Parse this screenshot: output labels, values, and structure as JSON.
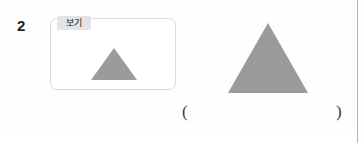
{
  "page": {
    "background_color": "#fefefe",
    "edge_rule_color": "#b3b5b6"
  },
  "question": {
    "number": "2"
  },
  "example_panel": {
    "label": "보기",
    "label_background": "#e3e4e5",
    "border_color": "#d9dbdc",
    "shape": {
      "icon_name": "triangle-shape",
      "fill_color": "#9a9c9c",
      "base_width_px": 46,
      "height_px": 32
    }
  },
  "target_shape": {
    "icon_name": "triangle-shape",
    "fill_color": "#9a9c9c",
    "base_width_px": 80,
    "height_px": 70
  },
  "answer_field": {
    "left_paren": "(",
    "right_paren": ")",
    "value": "",
    "placeholder": ""
  }
}
